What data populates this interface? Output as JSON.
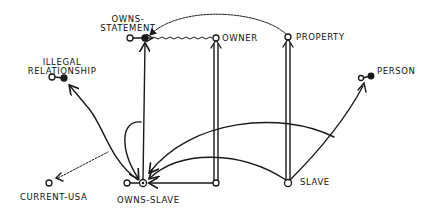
{
  "diagram": {
    "type": "concept-graph",
    "style": "hand-drawn",
    "nodes": {
      "owns_statement": {
        "line1": "OWNS-",
        "line2": "STATEMENT"
      },
      "owner": {
        "label": "OWNER"
      },
      "property": {
        "label": "PROPERTY"
      },
      "illegal_relationship": {
        "line1": "ILLEGAL",
        "line2": "RELATIONSHIP"
      },
      "person": {
        "label": "PERSON"
      },
      "current_usa": {
        "label": "CURRENT-USA"
      },
      "owns_slave": {
        "label": "OWNS-SLAVE"
      },
      "slave": {
        "label": "SLAVE"
      }
    },
    "edges": [
      {
        "from": "owns-slave",
        "to": "owns-statement",
        "style": "single-arrow"
      },
      {
        "from": "owner(bottom)",
        "to": "owner",
        "style": "double-line"
      },
      {
        "from": "slave",
        "to": "property",
        "style": "double-line"
      },
      {
        "from": "owner",
        "to": "owns-statement",
        "style": "wavy"
      },
      {
        "from": "property",
        "to": "owns-statement",
        "style": "wavy-arc"
      },
      {
        "from": "owns-slave",
        "to": "illegal-relationship",
        "style": "curve"
      },
      {
        "from": "current-usa",
        "to": "owns-slave",
        "style": "wavy"
      },
      {
        "from": "owner(bottom)",
        "to": "owns-slave",
        "style": "arrow"
      },
      {
        "from": "slave",
        "to": "owns-slave",
        "style": "arc"
      },
      {
        "from": "person",
        "to": "owns-slave",
        "style": "arc"
      },
      {
        "from": "owns-statement-line",
        "to": "owns-slave",
        "style": "loop"
      }
    ],
    "ink_color": "#1a1a1a"
  }
}
